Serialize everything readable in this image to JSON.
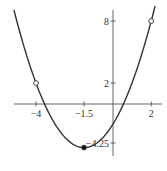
{
  "chart_data": {
    "type": "line",
    "title": "",
    "xlabel": "",
    "ylabel": "",
    "function": "f(x) = x^2 + 3x - 2 = (x + 1.5)^2 - 4.25",
    "domain_plotted": [
      -5.15,
      2.2
    ],
    "x_ticks": [
      {
        "value": -4,
        "label": "-4"
      },
      {
        "value": -1.5,
        "label": "-1.5"
      },
      {
        "value": 2,
        "label": "2"
      }
    ],
    "y_ticks": [
      {
        "value": 8,
        "label": "8"
      },
      {
        "value": 2,
        "label": "2"
      },
      {
        "value": -4.25,
        "label": "-4.25"
      }
    ],
    "points": [
      {
        "x": -4,
        "y": 2,
        "style": "open"
      },
      {
        "x": 2,
        "y": 8,
        "style": "open"
      },
      {
        "x": -1.5,
        "y": -4.25,
        "style": "filled"
      }
    ],
    "grid": false,
    "legend": null,
    "colors": {
      "curve": "#333333",
      "axis": "#555555"
    }
  }
}
